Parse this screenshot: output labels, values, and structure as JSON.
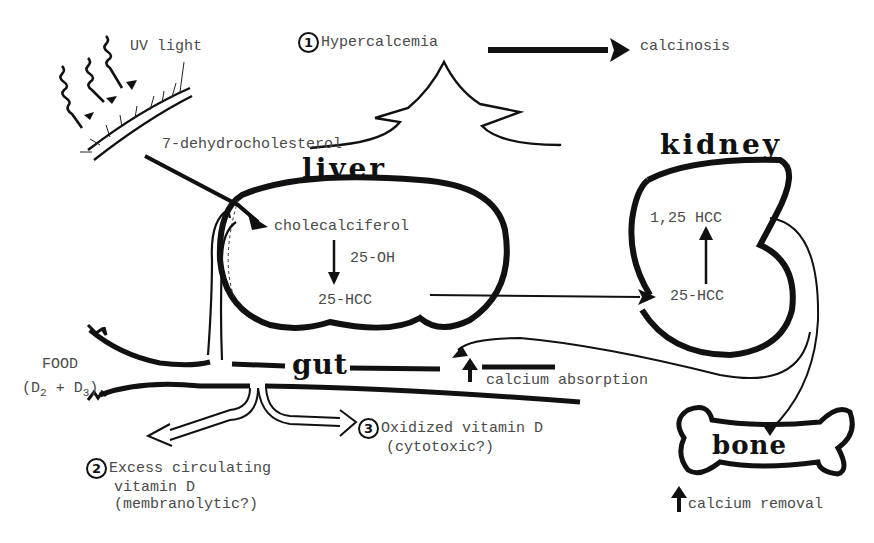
{
  "diagram": {
    "type": "vitamin D metabolism and toxicity pathway",
    "organs": {
      "liver": "liver",
      "kidney": "kidney",
      "gut": "gut",
      "bone": "bone"
    },
    "skin": {
      "uv_label": "UV light",
      "precursor": "7-dehydrocholesterol"
    },
    "liver": {
      "input": "cholecalciferol",
      "enzyme": "25-OH",
      "output": "25-HCC"
    },
    "kidney": {
      "input": "25-HCC",
      "output": "1,25 HCC"
    },
    "food": {
      "label": "FOOD",
      "sources_prefix": "(D",
      "d2_sub": "2",
      "plus": " + D",
      "d3_sub": "3",
      "suffix": ")"
    },
    "effects": {
      "gut": "calcium absorption",
      "bone": "calcium removal"
    },
    "toxicity": [
      {
        "num": "1",
        "label": "Hypercalcemia",
        "result": "calcinosis"
      },
      {
        "num": "2",
        "line1": "Excess circulating",
        "line2": "vitamin D",
        "line3": "(membranolytic?)"
      },
      {
        "num": "3",
        "line1": "Oxidized vitamin D",
        "line2": "(cytotoxic?)"
      }
    ]
  }
}
